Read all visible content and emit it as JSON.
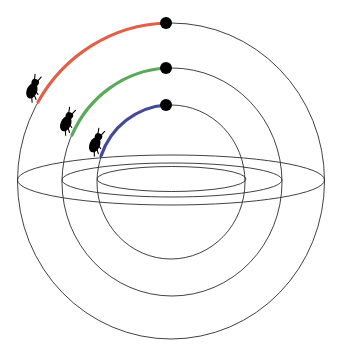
{
  "diagram": {
    "title": "Beetles climbing nested hemispherical shells",
    "background": "#ffffff",
    "line_color": "#2b2b2b",
    "shells": [
      {
        "name": "outer",
        "center": [
          171,
          181
        ],
        "rx": 153.5,
        "ry": 158,
        "equator_ry": 25,
        "arc_color": "#e0604a",
        "arc_start": [
          38,
          102
        ],
        "dot": [
          166,
          23
        ],
        "beetle_position": [
          35,
          88
        ]
      },
      {
        "name": "middle",
        "center": [
          172,
          182
        ],
        "rx": 110,
        "ry": 114,
        "equator_ry": 17,
        "arc_color": "#5aaa5a",
        "arc_start": [
          72,
          135
        ],
        "dot": [
          166,
          68
        ],
        "beetle_position": [
          69,
          121
        ]
      },
      {
        "name": "inner",
        "center": [
          171,
          182
        ],
        "rx": 74,
        "ry": 77,
        "equator_ry": 12.5,
        "arc_color": "#454a98",
        "arc_start": [
          101,
          156
        ],
        "dot": [
          166,
          105
        ],
        "beetle_position": [
          98,
          142
        ]
      }
    ],
    "icons": [
      "beetle-icon",
      "dot-marker"
    ]
  }
}
